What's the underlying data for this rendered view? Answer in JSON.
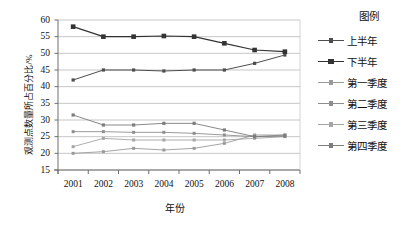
{
  "chart_data": {
    "type": "line",
    "title": "",
    "xlabel": "年份",
    "ylabel": "观测点数量所占百分比/%",
    "categories": [
      "2001",
      "2002",
      "2003",
      "2004",
      "2005",
      "2006",
      "2007",
      "2008"
    ],
    "x": [
      2001,
      2002,
      2003,
      2004,
      2005,
      2006,
      2007,
      2008
    ],
    "ylim": [
      15,
      60
    ],
    "ytick_labels": [
      "60",
      "55",
      "50",
      "45",
      "40",
      "35",
      "30",
      "25",
      "20",
      "15"
    ],
    "ytick_values": [
      60,
      55,
      50,
      45,
      40,
      35,
      30,
      25,
      20,
      15
    ],
    "grid": "horizontal",
    "legend_position": "right",
    "legend_title": "图例",
    "series": [
      {
        "name": "上半年",
        "values": [
          42,
          45,
          45,
          44.7,
          45,
          45,
          47,
          49.5
        ],
        "color": "#4d4d4d",
        "marker": "square-small",
        "marker_size": 3.2,
        "line_width": 1.0
      },
      {
        "name": "下半年",
        "values": [
          58,
          55,
          55,
          55.2,
          55,
          53,
          51,
          50.5
        ],
        "color": "#333333",
        "marker": "square-large",
        "marker_size": 4.6,
        "line_width": 1.2
      },
      {
        "name": "第一季度",
        "values": [
          20,
          20.5,
          21.5,
          21,
          21.5,
          23,
          25.5,
          25.5
        ],
        "color": "#9a9a9a",
        "marker": "square-small",
        "marker_size": 3.0,
        "line_width": 0.9
      },
      {
        "name": "第二季度",
        "values": [
          26.5,
          26.5,
          26.3,
          26.3,
          26,
          25.5,
          25,
          25.5
        ],
        "color": "#8e8e8e",
        "marker": "square-small",
        "marker_size": 3.0,
        "line_width": 0.9
      },
      {
        "name": "第三季度",
        "values": [
          22,
          24.5,
          24,
          24,
          24,
          24,
          24.5,
          25
        ],
        "color": "#a5a5a5",
        "marker": "square-small",
        "marker_size": 3.0,
        "line_width": 0.9
      },
      {
        "name": "第四季度",
        "values": [
          31.5,
          28.5,
          28.5,
          29,
          29,
          27,
          25,
          25.2
        ],
        "color": "#7c7c7c",
        "marker": "square-small",
        "marker_size": 3.2,
        "line_width": 0.9
      }
    ]
  },
  "style": {
    "plot_background": "#ffffff",
    "grid_color": "#b8b8b8",
    "axis_color": "#808080",
    "text_color": "#111111"
  }
}
